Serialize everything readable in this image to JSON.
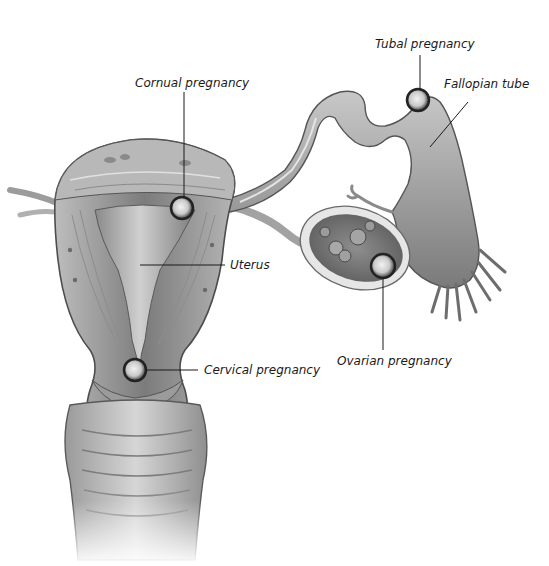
{
  "diagram": {
    "colors": {
      "background": "#ffffff",
      "tissue_light": "#d8d8d8",
      "tissue_mid": "#a9a9a9",
      "tissue_dark": "#6e6e6e",
      "outline": "#4a4a4a",
      "leader_line": "#1a1a1a",
      "label_text": "#1a1a1a"
    },
    "labels": {
      "cornual": "Cornual pregnancy",
      "tubal": "Tubal pregnancy",
      "fallopian_tube": "Fallopian tube",
      "uterus": "Uterus",
      "ovarian": "Ovarian pregnancy",
      "cervical": "Cervical pregnancy"
    }
  }
}
